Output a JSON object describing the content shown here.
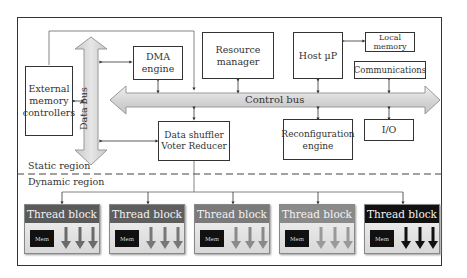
{
  "diagram": {
    "blocks": {
      "external_memory": "External memory controllers",
      "dma": "DMA engine",
      "resource_manager": "Resource manager",
      "host": "Host µP",
      "local_memory": "Local memory",
      "communications": "Communications",
      "data_shuffler": "Data shuffler Voter Reducer",
      "reconfiguration": "Reconfiguration engine",
      "io": "I/O"
    },
    "buses": {
      "data_bus": "Data bus",
      "control_bus": "Control bus"
    },
    "regions": {
      "static": "Static region",
      "dynamic": "Dynamic region"
    },
    "thread_blocks": [
      {
        "label": "Thread block",
        "mem": "Mem",
        "header_color": "#5a5a5a",
        "arrow_color": "#6a6a6a"
      },
      {
        "label": "Thread block",
        "mem": "Mem",
        "header_color": "#5e5e5e",
        "arrow_color": "#777777"
      },
      {
        "label": "Thread block",
        "mem": "Mem",
        "header_color": "#7a7a7a",
        "arrow_color": "#8a8a8a"
      },
      {
        "label": "Thread block",
        "mem": "Mem",
        "header_color": "#8a8a8a",
        "arrow_color": "#999999"
      },
      {
        "label": "Thread block",
        "mem": "Mem",
        "header_color": "#111111",
        "arrow_color": "#111111"
      }
    ]
  }
}
